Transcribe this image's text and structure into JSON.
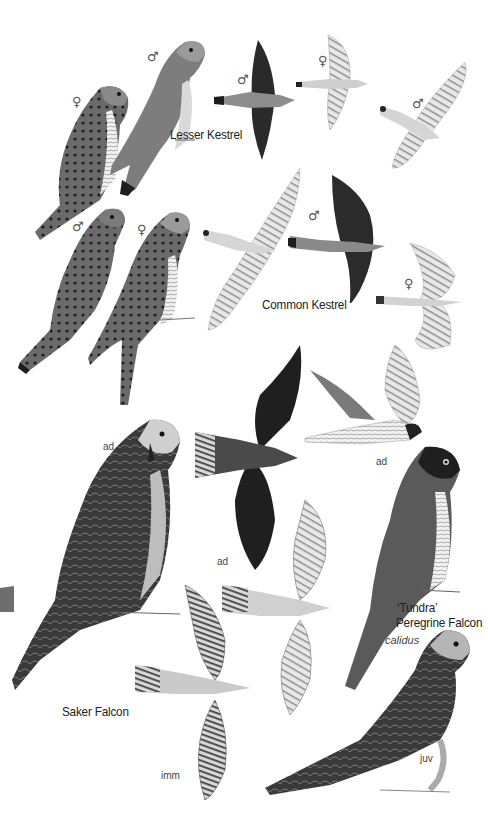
{
  "plate": {
    "background": "#ffffff",
    "species": [
      {
        "name": "Lesser Kestrel",
        "figures": [
          {
            "pose": "perched",
            "sex_symbol": "♀"
          },
          {
            "pose": "perched",
            "sex_symbol": "♂"
          },
          {
            "pose": "flight-dorsal",
            "sex_symbol": "♂"
          },
          {
            "pose": "flight-ventral",
            "sex_symbol": "♀"
          },
          {
            "pose": "flight-ventral",
            "sex_symbol": "♂"
          }
        ]
      },
      {
        "name": "Common Kestrel",
        "figures": [
          {
            "pose": "perched",
            "sex_symbol": "♂"
          },
          {
            "pose": "perched",
            "sex_symbol": "♀"
          },
          {
            "pose": "flight-ventral",
            "sex_symbol": ""
          },
          {
            "pose": "flight-dorsal",
            "sex_symbol": "♂"
          },
          {
            "pose": "flight-ventral",
            "sex_symbol": "♀"
          }
        ]
      },
      {
        "name": "Saker Falcon",
        "figures": [
          {
            "pose": "perched",
            "age": "ad"
          },
          {
            "pose": "flight-dorsal",
            "age": "ad"
          },
          {
            "pose": "flight-ventral",
            "age": ""
          },
          {
            "pose": "flight-ventral",
            "age": "imm"
          }
        ]
      },
      {
        "name_line1": "'Tundra'",
        "name_line2": "Peregrine Falcon",
        "scientific": "calidus",
        "figures": [
          {
            "pose": "flight-side",
            "age": "ad"
          },
          {
            "pose": "perched",
            "age": ""
          },
          {
            "pose": "perched",
            "age": "juv"
          }
        ]
      }
    ],
    "labels": {
      "lesser_kestrel": "Lesser Kestrel",
      "common_kestrel": "Common Kestrel",
      "saker_falcon": "Saker Falcon",
      "tundra_line1": "‘Tundra’",
      "tundra_line2": "Peregrine Falcon",
      "calidus": "calidus",
      "ad": "ad",
      "imm": "imm",
      "juv": "juv",
      "male": "♂",
      "female": "♀"
    }
  }
}
